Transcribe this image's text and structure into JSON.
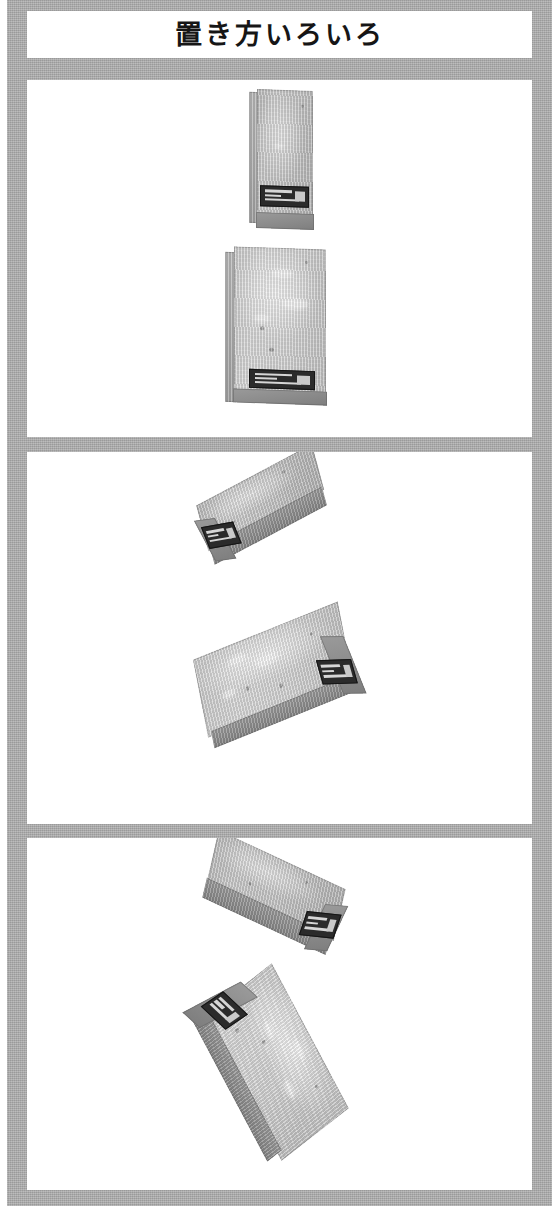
{
  "page": {
    "title": "置き方いろいろ",
    "background_color": "#ffffff",
    "frame_color": "#a9a9a9",
    "panel_color": "#ffffff",
    "width": 559,
    "height": 1211
  },
  "header": {
    "title": "置き方いろいろ"
  },
  "panels": [
    {
      "id": "panel-1",
      "name": "panel-upright",
      "objects": [
        {
          "name": "block-narrow-upright",
          "orientation": "vertical-upright",
          "rotation_deg": 0,
          "face": "narrow",
          "label_position": "bottom",
          "surface_color": "#bdbdbd"
        },
        {
          "name": "block-wide-upright",
          "orientation": "vertical-flat",
          "rotation_deg": 0,
          "face": "wide",
          "label_position": "bottom",
          "surface_color": "#d2d2d2"
        }
      ]
    },
    {
      "id": "panel-2",
      "name": "panel-tilted-left",
      "objects": [
        {
          "name": "block-narrow-tilted",
          "orientation": "diagonal",
          "rotation_deg": -28,
          "face": "narrow",
          "label_position": "lower-left-end",
          "surface_color": "#bdbdbd"
        },
        {
          "name": "block-wide-tilted",
          "orientation": "diagonal",
          "rotation_deg": -22,
          "face": "wide",
          "label_position": "lower-right-end",
          "surface_color": "#d2d2d2"
        }
      ]
    },
    {
      "id": "panel-3",
      "name": "panel-tilted-right",
      "objects": [
        {
          "name": "block-narrow-tilted-right",
          "orientation": "diagonal",
          "rotation_deg": 25,
          "face": "narrow",
          "label_position": "lower-right-end",
          "surface_color": "#bdbdbd"
        },
        {
          "name": "block-wide-tilted-right",
          "orientation": "diagonal",
          "rotation_deg": 62,
          "face": "wide",
          "label_position": "lower-left-end",
          "surface_color": "#d2d2d2"
        }
      ]
    }
  ],
  "labels": {
    "sticker_background": "#2b2b2b",
    "sticker_text_color": "#d6d6d6"
  }
}
